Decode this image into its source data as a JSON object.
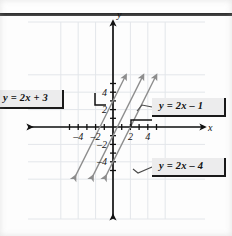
{
  "figure": {
    "axis_labels": {
      "x": "x",
      "y": "y"
    },
    "colors": {
      "line": "#8d8d8d",
      "axis": "#111111",
      "grid": "#e3e6ea",
      "label_fill": "#ececed",
      "label_border": "#1a1a1a",
      "background": "#fdfdfd"
    }
  },
  "chart_data": {
    "type": "line",
    "title": "",
    "xlabel": "x",
    "ylabel": "y",
    "xlim": [
      -5.8,
      5.6
    ],
    "ylim": [
      -5.8,
      5.6
    ],
    "xticks": [
      -4,
      -2,
      2,
      4
    ],
    "xtick_labels": [
      "–4",
      "–2",
      "2",
      "4"
    ],
    "yticks": [
      -4,
      -2,
      2,
      4
    ],
    "ytick_labels": [
      "–4",
      "–2",
      "2",
      "4"
    ],
    "grid": true,
    "grid_step": 2,
    "tick_step": 1,
    "legend": "callout-labels",
    "series": [
      {
        "name": "y = 2x + 3",
        "label": "y = 2x + 3",
        "slope": 2,
        "intercept": 3,
        "x_intercept": -1.5,
        "y_intercept": 3,
        "points": [
          [
            -4.4,
            -5.8
          ],
          [
            1.4,
            5.8
          ]
        ]
      },
      {
        "name": "y = 2x - 1",
        "label": "y = 2x – 1",
        "slope": 2,
        "intercept": -1,
        "x_intercept": 0.5,
        "y_intercept": -1,
        "points": [
          [
            -2.4,
            -5.8
          ],
          [
            3.4,
            5.8
          ]
        ]
      },
      {
        "name": "y = 2x - 4",
        "label": "y = 2x – 4",
        "slope": 2,
        "intercept": -4,
        "x_intercept": 2,
        "y_intercept": -4,
        "points": [
          [
            -0.9,
            -5.8
          ],
          [
            4.9,
            5.8
          ]
        ]
      }
    ]
  },
  "callouts": [
    {
      "id": "callout-1",
      "text": "y = 2x + 3"
    },
    {
      "id": "callout-2",
      "text": "y = 2x – 1"
    },
    {
      "id": "callout-3",
      "text": "y = 2x – 4"
    }
  ],
  "ticks": {
    "x_negative": [
      "–4",
      "–2"
    ],
    "x_positive": [
      "2",
      "4"
    ],
    "y_positive": [
      "2",
      "4"
    ],
    "y_negative": [
      "–2",
      "–4"
    ]
  }
}
